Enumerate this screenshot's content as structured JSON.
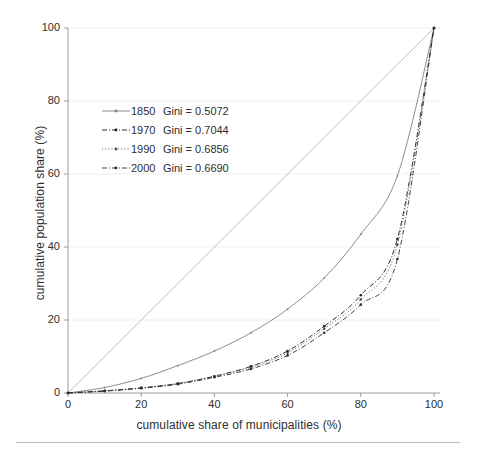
{
  "chart_data": {
    "type": "line",
    "title": "",
    "subtitle": "",
    "xlabel": "cumulative share of municipalities (%)",
    "ylabel": "cumulative population share (%)",
    "xlim": [
      0,
      100
    ],
    "ylim": [
      0,
      100
    ],
    "xticks": [
      0,
      20,
      40,
      60,
      80,
      100
    ],
    "yticks": [
      0,
      20,
      40,
      60,
      80,
      100
    ],
    "grid": "faint-horizontal-and-vertical",
    "legend_position": "upper-left-inside",
    "x": [
      0,
      10,
      20,
      30,
      40,
      50,
      60,
      70,
      80,
      90,
      100
    ],
    "series": [
      {
        "name": "1850",
        "label": "1850",
        "gini_label": "Gini = 0.5072",
        "gini": 0.5072,
        "linestyle": "solid",
        "marker": "dot",
        "color": "#808080",
        "values": [
          0,
          1.5,
          4.0,
          7.5,
          11.5,
          16.5,
          23.0,
          31.5,
          43.5,
          59.5,
          100
        ]
      },
      {
        "name": "1970",
        "label": "1970",
        "gini_label": "Gini = 0.7044",
        "gini": 0.7044,
        "linestyle": "dashdot",
        "marker": "dot",
        "color": "#1a1a1a",
        "values": [
          0,
          0.6,
          1.4,
          2.6,
          4.6,
          7.3,
          11.5,
          18.3,
          26.8,
          42.2,
          100
        ]
      },
      {
        "name": "1990",
        "label": "1990",
        "gini_label": "Gini = 0.6856",
        "gini": 0.6856,
        "linestyle": "dotted",
        "marker": "dot",
        "color": "#4a4a4a",
        "values": [
          0,
          0.6,
          1.4,
          2.6,
          4.6,
          7.0,
          11.0,
          17.6,
          25.6,
          40.6,
          100
        ]
      },
      {
        "name": "2000",
        "label": "2000",
        "gini_label": "Gini = 0.6690",
        "gini": 0.669,
        "linestyle": "dashdot",
        "marker": "dot",
        "color": "#2e2e2e",
        "values": [
          0,
          0.5,
          1.3,
          2.4,
          4.3,
          6.6,
          10.3,
          16.5,
          24.2,
          36.7,
          100
        ]
      },
      {
        "name": "equality-line",
        "label": "",
        "gini_label": "",
        "gini": 0,
        "linestyle": "solid",
        "marker": "none",
        "color": "#b0b0b0",
        "values": [
          0,
          10,
          20,
          30,
          40,
          50,
          60,
          70,
          80,
          90,
          100
        ]
      }
    ]
  },
  "axes": {
    "x_title": "cumulative share of municipalities (%)",
    "y_title": "cumulative population share (%)",
    "x_tick_labels": [
      "0",
      "20",
      "40",
      "60",
      "80",
      "100"
    ],
    "y_tick_labels": [
      "0",
      "20",
      "40",
      "60",
      "80",
      "100"
    ]
  },
  "legend": {
    "rows": [
      {
        "year": "1850",
        "gini": "Gini = 0.5072"
      },
      {
        "year": "1970",
        "gini": "Gini = 0.7044"
      },
      {
        "year": "1990",
        "gini": "Gini = 0.6856"
      },
      {
        "year": "2000",
        "gini": "Gini = 0.6690"
      }
    ]
  },
  "colors": {
    "axis": "#9a9a9a",
    "grid": "#f0f0f0",
    "text": "#2e2e2e",
    "equality_line": "#b0b0b0",
    "rule": "#bcbcbc"
  }
}
